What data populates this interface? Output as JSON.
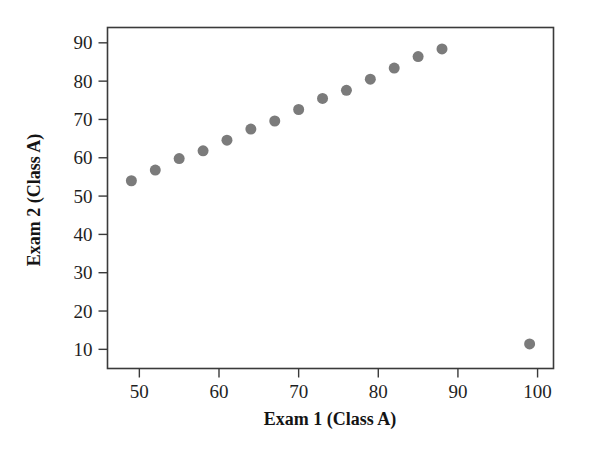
{
  "figure": {
    "background_color": "#ffffff",
    "frame_color": "#3a3a3a",
    "marker_color": "#7b7b7b"
  },
  "axes": {
    "x_title": "Exam 1 (Class A)",
    "y_title": "Exam 2 (Class A)",
    "x_ticks": [
      "50",
      "60",
      "70",
      "80",
      "90",
      "100"
    ],
    "y_ticks": [
      "10",
      "20",
      "30",
      "40",
      "50",
      "60",
      "70",
      "80",
      "90"
    ]
  },
  "chart_data": {
    "type": "scatter",
    "title": "",
    "xlabel": "Exam 1 (Class A)",
    "ylabel": "Exam 2 (Class A)",
    "xlim": [
      46,
      102
    ],
    "ylim": [
      5,
      94
    ],
    "xticks": [
      50,
      60,
      70,
      80,
      90,
      100
    ],
    "yticks": [
      10,
      20,
      30,
      40,
      50,
      60,
      70,
      80,
      90
    ],
    "grid": false,
    "legend": null,
    "marker": "circle",
    "marker_color": "#7b7b7b",
    "marker_size": 11,
    "x": [
      49,
      52,
      55,
      58,
      61,
      64,
      67,
      70,
      73,
      76,
      79,
      82,
      85,
      88,
      99
    ],
    "y": [
      54.0,
      56.8,
      59.8,
      61.8,
      64.6,
      67.5,
      69.6,
      72.6,
      75.5,
      77.6,
      80.5,
      83.4,
      86.4,
      88.4,
      11.4
    ],
    "points": [
      {
        "x": 49,
        "y": 54.0
      },
      {
        "x": 52,
        "y": 56.8
      },
      {
        "x": 55,
        "y": 59.8
      },
      {
        "x": 58,
        "y": 61.8
      },
      {
        "x": 61,
        "y": 64.6
      },
      {
        "x": 64,
        "y": 67.5
      },
      {
        "x": 67,
        "y": 69.6
      },
      {
        "x": 70,
        "y": 72.6
      },
      {
        "x": 73,
        "y": 75.5
      },
      {
        "x": 76,
        "y": 77.6
      },
      {
        "x": 79,
        "y": 80.5
      },
      {
        "x": 82,
        "y": 83.4
      },
      {
        "x": 85,
        "y": 86.4
      },
      {
        "x": 88,
        "y": 88.4
      },
      {
        "x": 99,
        "y": 11.4
      }
    ],
    "annotations": []
  }
}
